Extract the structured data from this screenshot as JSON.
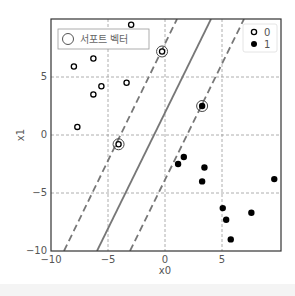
{
  "chart_data": {
    "type": "scatter",
    "title": "",
    "xlabel": "x0",
    "ylabel": "x1",
    "xlim": [
      -10,
      10
    ],
    "ylim": [
      -10,
      10
    ],
    "xticks": [
      -10,
      -5,
      0,
      5
    ],
    "yticks": [
      -10,
      -5,
      0,
      5
    ],
    "grid": true,
    "series": [
      {
        "name": "0",
        "marker": "open-circle",
        "points": [
          [
            -8.0,
            5.9
          ],
          [
            -6.3,
            6.6
          ],
          [
            -6.3,
            3.5
          ],
          [
            -5.6,
            4.2
          ],
          [
            -3.4,
            4.5
          ],
          [
            -7.7,
            0.7
          ],
          [
            -4.1,
            -0.8
          ],
          [
            -3.0,
            9.5
          ],
          [
            -0.3,
            7.2
          ]
        ]
      },
      {
        "name": "1",
        "marker": "filled-circle",
        "points": [
          [
            1.1,
            -2.5
          ],
          [
            1.6,
            -1.9
          ],
          [
            3.4,
            -2.8
          ],
          [
            3.2,
            -4.0
          ],
          [
            9.5,
            -3.8
          ],
          [
            5.0,
            -6.3
          ],
          [
            5.3,
            -7.3
          ],
          [
            7.5,
            -6.7
          ],
          [
            5.7,
            -9.0
          ],
          [
            3.2,
            2.5
          ]
        ]
      }
    ],
    "support_vectors": [
      [
        -4.1,
        -0.8
      ],
      [
        -0.3,
        7.2
      ],
      [
        3.2,
        2.5
      ]
    ],
    "lines": [
      {
        "name": "margin-left",
        "style": "dashed",
        "from": [
          -8.9,
          -10
        ],
        "to": [
          1.0,
          10
        ]
      },
      {
        "name": "decision-boundary",
        "style": "solid",
        "from": [
          -6.0,
          -10
        ],
        "to": [
          4.0,
          10
        ]
      },
      {
        "name": "margin-right",
        "style": "dashed",
        "from": [
          -3.1,
          -10
        ],
        "to": [
          6.9,
          10
        ]
      }
    ],
    "legend": {
      "support_vector_label": "서포트 벡터",
      "class_labels": [
        "0",
        "1"
      ],
      "positions": [
        "upper-left",
        "upper-right"
      ]
    }
  },
  "axes": {
    "xtick_labels": [
      "−10",
      "−5",
      "0",
      "5"
    ],
    "ytick_labels": [
      "−10",
      "−5",
      "0",
      "5"
    ],
    "xlabel": "x0",
    "ylabel": "x1"
  },
  "legend": {
    "sv_label": "서포트 벡터",
    "class0": "0",
    "class1": "1"
  }
}
